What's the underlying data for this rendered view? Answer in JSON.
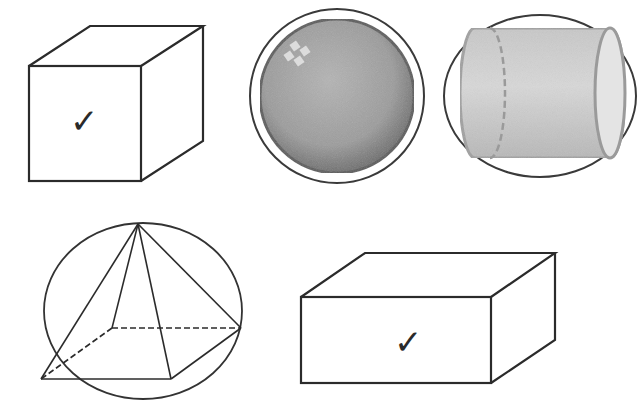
{
  "figure": {
    "colors": {
      "line": "#2b2b2b",
      "sphere_fill": "#9a9a9a",
      "sphere_rim": "#5a5a5a",
      "cylinder_fill": "#c4c4c4",
      "cylinder_edge": "#9a9a9a",
      "background": "#ffffff"
    },
    "shapes": [
      {
        "id": "cube",
        "type": "cube",
        "marked": true,
        "mark": "✓"
      },
      {
        "id": "sphere",
        "type": "sphere",
        "enclosed_by": "circle",
        "marked": false
      },
      {
        "id": "cylinder",
        "type": "cylinder",
        "enclosed_by": "ellipse",
        "marked": false
      },
      {
        "id": "pyramid",
        "type": "square-pyramid",
        "enclosed_by": "ellipse",
        "marked": false
      },
      {
        "id": "box",
        "type": "rectangular-prism",
        "marked": true,
        "mark": "✓"
      }
    ]
  }
}
